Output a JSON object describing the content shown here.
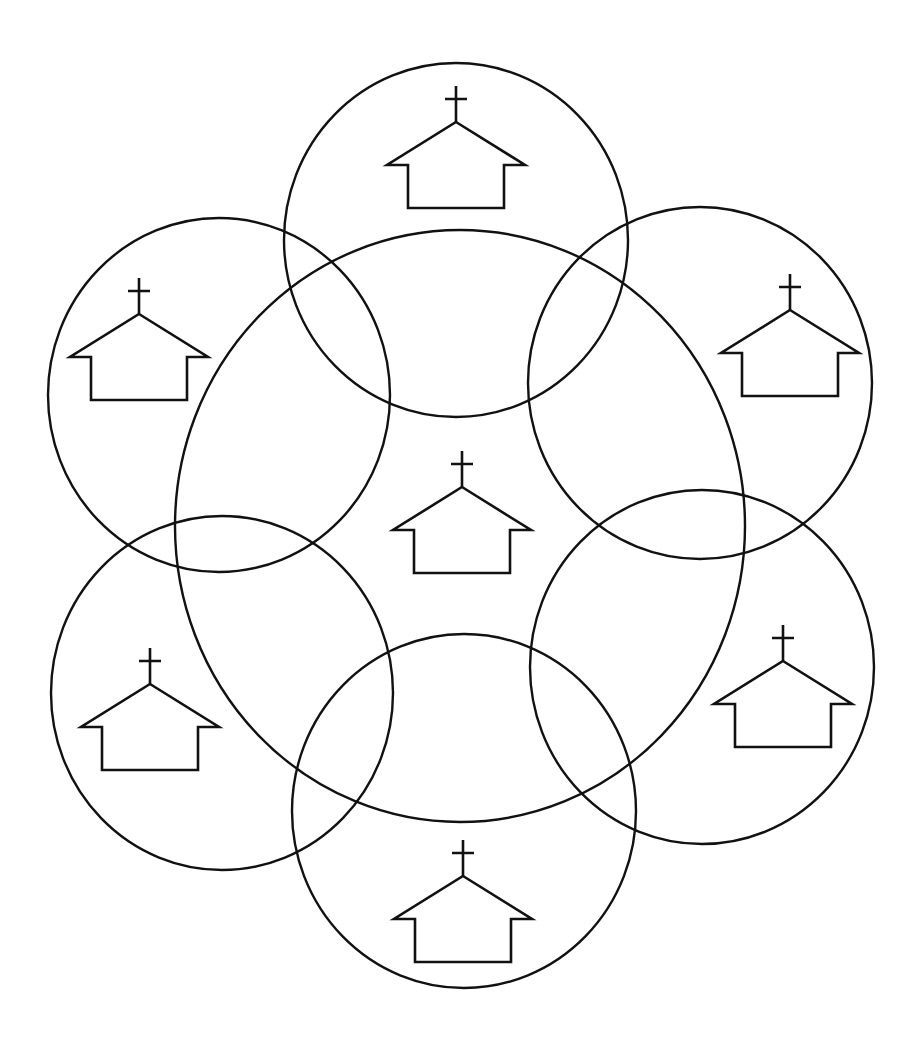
{
  "diagram": {
    "description": "Seven overlapping circles, each containing a church icon: one large central circle surrounded by six smaller circles",
    "stroke_color": "#111111",
    "background": "#ffffff",
    "circles": [
      {
        "id": "center",
        "label": "central-church-circle",
        "cx": 460,
        "cy": 526,
        "rx": 285,
        "ry": 296
      },
      {
        "id": "top",
        "label": "top-church-circle",
        "cx": 456,
        "cy": 240,
        "rx": 172,
        "ry": 177
      },
      {
        "id": "upper-left",
        "label": "upper-left-church-circle",
        "cx": 219,
        "cy": 395,
        "rx": 171,
        "ry": 177
      },
      {
        "id": "upper-right",
        "label": "upper-right-church-circle",
        "cx": 700,
        "cy": 383,
        "rx": 172,
        "ry": 176
      },
      {
        "id": "lower-left",
        "label": "lower-left-church-circle",
        "cx": 222,
        "cy": 693,
        "rx": 171,
        "ry": 177
      },
      {
        "id": "lower-right",
        "label": "lower-right-church-circle",
        "cx": 702,
        "cy": 667,
        "rx": 172,
        "ry": 177
      },
      {
        "id": "bottom",
        "label": "bottom-church-circle",
        "cx": 464,
        "cy": 811,
        "rx": 172,
        "ry": 177
      }
    ],
    "churches": [
      {
        "id": "center",
        "icon": "church-icon",
        "x": 462,
        "y": 487
      },
      {
        "id": "top",
        "icon": "church-icon",
        "x": 456,
        "y": 122
      },
      {
        "id": "upper-left",
        "icon": "church-icon",
        "x": 139,
        "y": 314
      },
      {
        "id": "upper-right",
        "icon": "church-icon",
        "x": 790,
        "y": 310
      },
      {
        "id": "lower-left",
        "icon": "church-icon",
        "x": 150,
        "y": 684
      },
      {
        "id": "lower-right",
        "icon": "church-icon",
        "x": 783,
        "y": 661
      },
      {
        "id": "bottom",
        "icon": "church-icon",
        "x": 463,
        "y": 876
      }
    ]
  }
}
